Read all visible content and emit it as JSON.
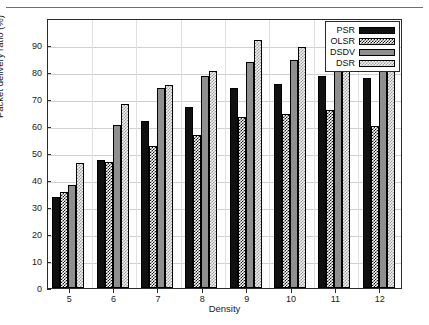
{
  "chart_data": {
    "type": "bar",
    "title": "",
    "xlabel": "Density",
    "ylabel": "Packet delivery ratio (%)",
    "categories": [
      "5",
      "6",
      "7",
      "8",
      "9",
      "10",
      "11",
      "12"
    ],
    "series": [
      {
        "name": "PSR",
        "values": [
          33.8,
          47.3,
          61.9,
          67.0,
          74.2,
          75.5,
          78.4,
          77.6
        ]
      },
      {
        "name": "OLSR",
        "values": [
          35.4,
          46.5,
          52.6,
          56.6,
          63.5,
          64.5,
          66.1,
          59.9
        ]
      },
      {
        "name": "DSDV",
        "values": [
          38.1,
          60.2,
          74.1,
          78.4,
          83.6,
          84.3,
          86.5,
          85.9
        ]
      },
      {
        "name": "DSR",
        "values": [
          46.3,
          68.3,
          75.3,
          80.2,
          92.0,
          89.3,
          83.3,
          80.2
        ]
      }
    ],
    "ylim": [
      0,
      100
    ],
    "yticks": [
      0,
      10,
      20,
      30,
      40,
      50,
      60,
      70,
      80,
      90
    ],
    "ytick_labels": [
      "0",
      "10",
      "20",
      "30",
      "40",
      "50",
      "60",
      "70",
      "80",
      "90"
    ],
    "xtick_labels": [
      "5",
      "6",
      "7",
      "8",
      "9",
      "10",
      "11",
      "12"
    ],
    "grid": true,
    "legend_position": "top-right",
    "legend_entries": [
      {
        "label": "PSR",
        "style": "solid-black",
        "color": "#101010"
      },
      {
        "label": "OLSR",
        "style": "checkered-dark",
        "color": "#1a1a1a"
      },
      {
        "label": "DSDV",
        "style": "solid-gray",
        "color": "#8f8f8f"
      },
      {
        "label": "DSR",
        "style": "checkered-light",
        "color": "#d8d8d8"
      }
    ]
  }
}
